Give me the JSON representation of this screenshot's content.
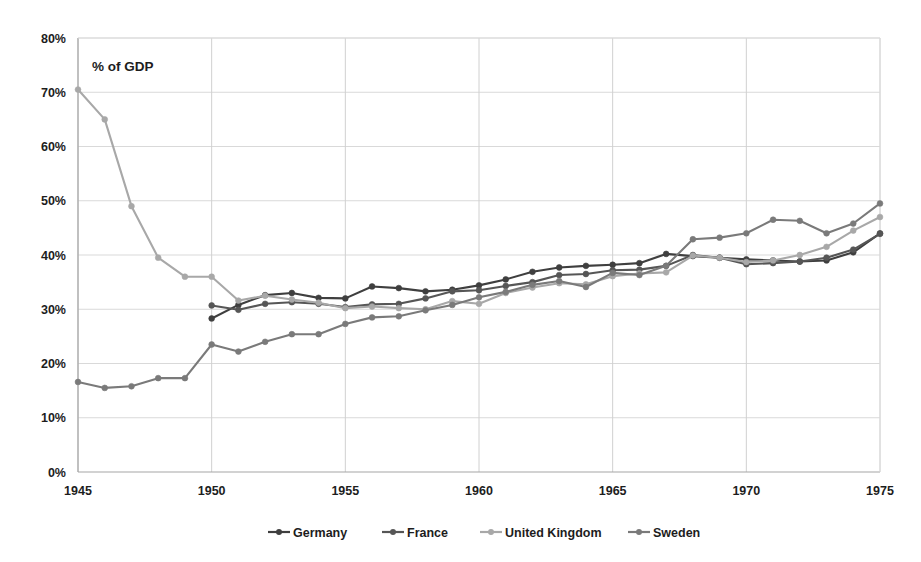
{
  "chart_data": {
    "type": "line",
    "title": "",
    "subtitle": "",
    "annotation": "% of GDP",
    "xlabel": "",
    "ylabel": "",
    "xlim": [
      1945,
      1975
    ],
    "ylim": [
      0,
      80
    ],
    "grid": true,
    "legend_position": "bottom",
    "x_tick_labels": [
      "1945",
      "1950",
      "1955",
      "1960",
      "1965",
      "1970",
      "1975"
    ],
    "x_ticks": [
      1945,
      1950,
      1955,
      1960,
      1965,
      1970,
      1975
    ],
    "y_tick_labels": [
      "0%",
      "10%",
      "20%",
      "30%",
      "40%",
      "50%",
      "60%",
      "70%",
      "80%"
    ],
    "y_ticks": [
      0,
      10,
      20,
      30,
      40,
      50,
      60,
      70,
      80
    ],
    "y_unit": "%",
    "series": [
      {
        "name": "Germany",
        "color": "#3f3f3f",
        "x": [
          1950,
          1951,
          1952,
          1953,
          1954,
          1955,
          1956,
          1957,
          1958,
          1959,
          1960,
          1961,
          1962,
          1963,
          1964,
          1965,
          1966,
          1967,
          1968,
          1969,
          1970,
          1971,
          1972,
          1973,
          1974,
          1975
        ],
        "values": [
          28.3,
          30.8,
          32.6,
          33.0,
          32.1,
          32.0,
          34.2,
          33.9,
          33.3,
          33.6,
          34.4,
          35.5,
          36.9,
          37.7,
          38.0,
          38.2,
          38.5,
          40.2,
          39.8,
          39.5,
          39.2,
          39.0,
          38.8,
          39.0,
          40.5,
          44.0
        ]
      },
      {
        "name": "France",
        "color": "#565656",
        "x": [
          1950,
          1951,
          1952,
          1953,
          1954,
          1955,
          1956,
          1957,
          1958,
          1959,
          1960,
          1961,
          1962,
          1963,
          1964,
          1965,
          1966,
          1967,
          1968,
          1969,
          1970,
          1971,
          1972,
          1973,
          1974,
          1975
        ],
        "values": [
          30.7,
          29.9,
          31.0,
          31.3,
          31.0,
          30.4,
          30.9,
          31.0,
          32.0,
          33.3,
          33.5,
          34.3,
          35.0,
          36.3,
          36.5,
          37.2,
          37.3,
          38.0,
          40.0,
          39.5,
          38.3,
          38.5,
          38.8,
          39.5,
          41.0,
          43.9
        ]
      },
      {
        "name": "United Kingdom",
        "color": "#a8a8a8",
        "x": [
          1945,
          1946,
          1947,
          1948,
          1949,
          1950,
          1951,
          1952,
          1953,
          1954,
          1955,
          1956,
          1957,
          1958,
          1959,
          1960,
          1961,
          1962,
          1963,
          1964,
          1965,
          1966,
          1967,
          1968,
          1969,
          1970,
          1971,
          1972,
          1973,
          1974,
          1975
        ],
        "values": [
          70.5,
          65.0,
          49.0,
          39.5,
          36.0,
          36.0,
          31.6,
          32.5,
          31.8,
          31.2,
          30.2,
          30.5,
          30.2,
          30.0,
          31.5,
          31.0,
          33.0,
          34.0,
          34.8,
          34.6,
          36.1,
          36.6,
          36.8,
          39.9,
          39.5,
          38.7,
          39.0,
          40.0,
          41.5,
          44.5,
          47.0
        ]
      },
      {
        "name": "Sweden",
        "color": "#7a7a7a",
        "x": [
          1945,
          1946,
          1947,
          1948,
          1949,
          1950,
          1951,
          1952,
          1953,
          1954,
          1955,
          1956,
          1957,
          1958,
          1959,
          1960,
          1961,
          1962,
          1963,
          1964,
          1965,
          1966,
          1967,
          1968,
          1969,
          1970,
          1971,
          1972,
          1973,
          1974,
          1975
        ],
        "values": [
          16.6,
          15.5,
          15.8,
          17.3,
          17.3,
          23.5,
          22.2,
          24.0,
          25.4,
          25.4,
          27.3,
          28.5,
          28.7,
          29.8,
          30.8,
          32.2,
          33.2,
          34.5,
          35.2,
          34.1,
          36.7,
          36.3,
          38.0,
          42.9,
          43.2,
          44.0,
          46.5,
          46.3,
          44.0,
          45.8,
          49.5
        ]
      }
    ]
  },
  "legend": {
    "items": [
      {
        "label": "Germany",
        "color": "#3f3f3f"
      },
      {
        "label": "France",
        "color": "#565656"
      },
      {
        "label": "United Kingdom",
        "color": "#a8a8a8"
      },
      {
        "label": "Sweden",
        "color": "#7a7a7a"
      }
    ]
  }
}
